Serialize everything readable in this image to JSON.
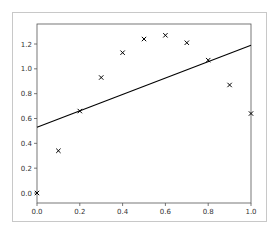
{
  "chart_data": {
    "type": "scatter",
    "title": "",
    "xlabel": "",
    "ylabel": "",
    "xlim": [
      0.0,
      1.0
    ],
    "ylim": [
      -0.06,
      1.35
    ],
    "grid": false,
    "legend": null,
    "xticks": [
      "0.0",
      "0.2",
      "0.4",
      "0.6",
      "0.8",
      "1.0"
    ],
    "yticks": [
      "0.0",
      "0.2",
      "0.4",
      "0.6",
      "0.8",
      "1.0",
      "1.2"
    ],
    "series": [
      {
        "name": "data",
        "type": "scatter",
        "marker": "x",
        "color": "#000000",
        "x": [
          0.0,
          0.1,
          0.2,
          0.3,
          0.4,
          0.5,
          0.6,
          0.7,
          0.8,
          0.9,
          1.0
        ],
        "y": [
          0.0,
          0.34,
          0.66,
          0.93,
          1.13,
          1.24,
          1.27,
          1.21,
          1.07,
          0.87,
          0.64
        ]
      },
      {
        "name": "linear fit",
        "type": "line",
        "color": "#000000",
        "x": [
          0.0,
          1.0
        ],
        "y": [
          0.53,
          1.19
        ]
      }
    ]
  }
}
